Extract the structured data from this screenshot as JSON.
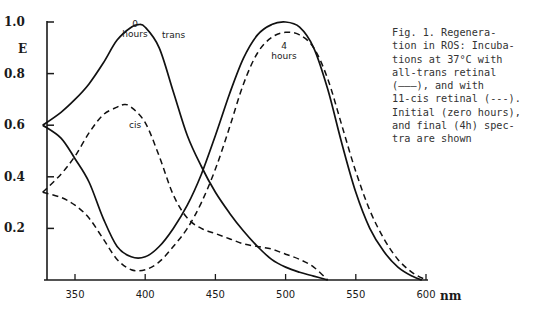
{
  "figure": {
    "caption": "Fig. 1. Regenera-\ntion in ROS: Incuba-\ntions at 37°C with\nall-trans retinal\n(———), and with\n11-cis retinal (---).\nInitial (zero hours),\nand final (4h) spec-\ntra are shown"
  },
  "chart_data": {
    "type": "line",
    "xlabel": "nm",
    "ylabel": "E",
    "xlim": [
      327,
      600
    ],
    "ylim": [
      0,
      1.0
    ],
    "x_ticks": [
      350,
      400,
      450,
      500,
      550,
      600
    ],
    "y_ticks": [
      0.2,
      0.4,
      0.6,
      0.8,
      1.0
    ],
    "y_tick_labels": [
      "0.2",
      "0.4",
      "0.6",
      "0.8",
      "1.0"
    ],
    "x_tick_labels": [
      "350",
      "400",
      "450",
      "500",
      "550",
      "600"
    ],
    "grid": false,
    "legend": "in caption",
    "annotations": [
      "0 hours",
      "trans",
      "cis",
      "4 hours"
    ],
    "series": [
      {
        "name": "all-trans, 0 hours",
        "style": "solid",
        "x": [
          327,
          340,
          350,
          360,
          370,
          380,
          390,
          395,
          400,
          410,
          420,
          430,
          440,
          450,
          460,
          470,
          480,
          490,
          500,
          510,
          520,
          530
        ],
        "y": [
          0.6,
          0.65,
          0.7,
          0.76,
          0.84,
          0.93,
          0.98,
          0.99,
          0.98,
          0.9,
          0.73,
          0.56,
          0.44,
          0.34,
          0.26,
          0.19,
          0.13,
          0.08,
          0.05,
          0.03,
          0.015,
          0.0
        ]
      },
      {
        "name": "11-cis, 0 hours",
        "style": "dashed",
        "x": [
          327,
          340,
          350,
          360,
          370,
          380,
          385,
          390,
          400,
          410,
          420,
          430,
          440,
          450,
          460,
          470,
          480,
          490,
          500,
          510,
          520,
          530
        ],
        "y": [
          0.34,
          0.41,
          0.48,
          0.57,
          0.64,
          0.67,
          0.68,
          0.67,
          0.61,
          0.48,
          0.33,
          0.24,
          0.2,
          0.18,
          0.16,
          0.14,
          0.13,
          0.12,
          0.1,
          0.08,
          0.05,
          0.0
        ]
      },
      {
        "name": "all-trans, 4 hours",
        "style": "solid",
        "x": [
          327,
          340,
          350,
          360,
          370,
          380,
          390,
          400,
          410,
          420,
          430,
          440,
          450,
          460,
          470,
          480,
          490,
          500,
          510,
          520,
          530,
          540,
          550,
          560,
          570,
          580,
          590,
          597
        ],
        "y": [
          0.6,
          0.55,
          0.47,
          0.38,
          0.24,
          0.13,
          0.09,
          0.09,
          0.13,
          0.2,
          0.29,
          0.41,
          0.56,
          0.72,
          0.86,
          0.95,
          0.99,
          1.0,
          0.98,
          0.9,
          0.74,
          0.53,
          0.34,
          0.2,
          0.11,
          0.05,
          0.015,
          0.0
        ]
      },
      {
        "name": "11-cis, 4 hours",
        "style": "dashed",
        "x": [
          327,
          340,
          350,
          360,
          370,
          380,
          390,
          400,
          410,
          420,
          430,
          440,
          450,
          460,
          470,
          480,
          490,
          500,
          510,
          520,
          530,
          540,
          550,
          560,
          570,
          580,
          590,
          600
        ],
        "y": [
          0.34,
          0.32,
          0.29,
          0.24,
          0.16,
          0.08,
          0.04,
          0.04,
          0.07,
          0.13,
          0.2,
          0.3,
          0.43,
          0.59,
          0.76,
          0.88,
          0.94,
          0.96,
          0.95,
          0.9,
          0.78,
          0.6,
          0.42,
          0.27,
          0.16,
          0.08,
          0.03,
          0.0
        ]
      }
    ]
  }
}
